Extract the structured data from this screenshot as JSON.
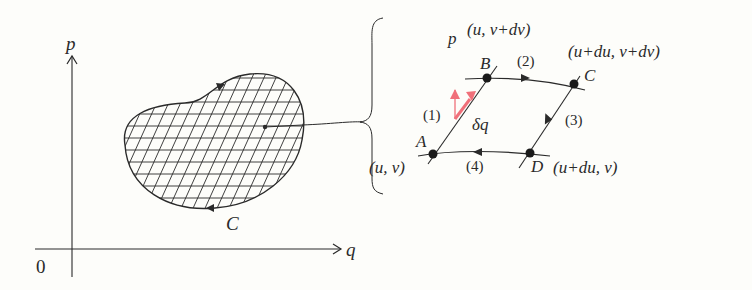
{
  "axes": {
    "vertical_label": "p",
    "horizontal_label": "q",
    "origin_label": "0"
  },
  "region": {
    "curve_label": "C",
    "fill": "crosshatch grid"
  },
  "cell": {
    "points": {
      "A": {
        "label": "A",
        "coords": "(u, v)"
      },
      "B": {
        "label": "B",
        "coords": "(u, v+dv)"
      },
      "C": {
        "label": "C",
        "coords": "(u+du, v+dv)"
      },
      "D": {
        "label": "D",
        "coords": "(u+du, v)"
      }
    },
    "edges": [
      "(1)",
      "(2)",
      "(3)",
      "(4)"
    ],
    "displacement_label": "δq",
    "momentum_label": "p"
  },
  "colors": {
    "ink": "#2a2a2a",
    "accent_red": "#f0707a",
    "background": "#fdfdfa"
  }
}
